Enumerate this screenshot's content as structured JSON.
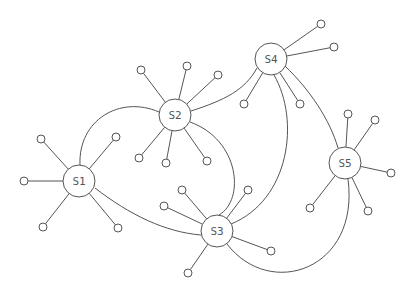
{
  "diagram": {
    "type": "network-graph",
    "stroke_color": "#555555",
    "background": "#ffffff",
    "hub_radius": 16,
    "leaf_radius": 4,
    "hubs": [
      {
        "id": "S1",
        "label": "S1",
        "x": 79,
        "y": 181,
        "leaves": [
          [
            41,
            139
          ],
          [
            116,
            137
          ],
          [
            24,
            181
          ],
          [
            43,
            227
          ],
          [
            118,
            228
          ]
        ]
      },
      {
        "id": "S2",
        "label": "S2",
        "x": 175,
        "y": 115,
        "leaves": [
          [
            141,
            70
          ],
          [
            187,
            66
          ],
          [
            218,
            75
          ],
          [
            139,
            158
          ],
          [
            166,
            163
          ],
          [
            207,
            161
          ]
        ]
      },
      {
        "id": "S3",
        "label": "S3",
        "x": 217,
        "y": 231,
        "leaves": [
          [
            182,
            190
          ],
          [
            248,
            190
          ],
          [
            164,
            206
          ],
          [
            271,
            251
          ],
          [
            188,
            273
          ]
        ]
      },
      {
        "id": "S4",
        "label": "S4",
        "x": 271,
        "y": 59,
        "leaves": [
          [
            321,
            24
          ],
          [
            334,
            47
          ],
          [
            244,
            104
          ],
          [
            300,
            104
          ]
        ]
      },
      {
        "id": "S5",
        "label": "S5",
        "x": 345,
        "y": 163,
        "leaves": [
          [
            348,
            114
          ],
          [
            375,
            120
          ],
          [
            391,
            173
          ],
          [
            310,
            208
          ],
          [
            368,
            211
          ]
        ]
      }
    ],
    "edges": [
      {
        "from": "S1",
        "to": "S2",
        "path": "M 80 165 C 78 120, 120 95, 159 112"
      },
      {
        "from": "S1",
        "to": "S3",
        "path": "M 95 188 C 130 215, 165 232, 201 235"
      },
      {
        "from": "S2",
        "to": "S3",
        "path": "M 190 122 C 240 140, 245 200, 219 215"
      },
      {
        "from": "S2",
        "to": "S4",
        "path": "M 191 111 C 225 100, 245 90, 257 68"
      },
      {
        "from": "S4",
        "to": "S3",
        "path": "M 274 75 C 300 120, 290 200, 231 224"
      },
      {
        "from": "S4",
        "to": "S5",
        "path": "M 285 66 C 310 90, 330 120, 338 148"
      },
      {
        "from": "S5",
        "to": "S3",
        "path": "M 348 179 C 360 270, 270 300, 227 244"
      }
    ]
  }
}
